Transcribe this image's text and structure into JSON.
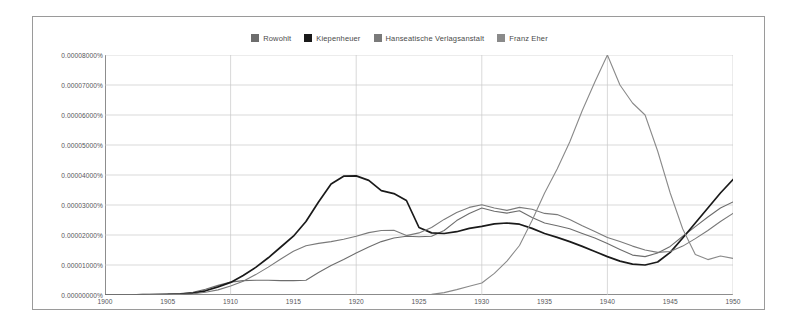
{
  "chart_data": {
    "type": "line",
    "title": "",
    "subtitle": "",
    "xlabel": "",
    "ylabel": "",
    "xlim": [
      1900,
      1950
    ],
    "ylim": [
      0,
      8e-05
    ],
    "grid": true,
    "legend_position": "top-center",
    "x_ticks": [
      "1900",
      "1905",
      "1910",
      "1915",
      "1920",
      "1925",
      "1930",
      "1935",
      "1940",
      "1945",
      "1950"
    ],
    "x_tick_values": [
      1900,
      1905,
      1910,
      1915,
      1920,
      1925,
      1930,
      1935,
      1940,
      1945,
      1950
    ],
    "y_ticks": [
      "0.00000000%",
      "0.00001000%",
      "0.00002000%",
      "0.00003000%",
      "0.00004000%",
      "0.00005000%",
      "0.00006000%",
      "0.00007000%",
      "0.00008000%"
    ],
    "y_tick_values": [
      0,
      1e-05,
      2e-05,
      3e-05,
      4e-05,
      5e-05,
      6e-05,
      7e-05,
      8e-05
    ],
    "x": [
      1900,
      1901,
      1902,
      1903,
      1904,
      1905,
      1906,
      1907,
      1908,
      1909,
      1910,
      1911,
      1912,
      1913,
      1914,
      1915,
      1916,
      1917,
      1918,
      1919,
      1920,
      1921,
      1922,
      1923,
      1924,
      1925,
      1926,
      1927,
      1928,
      1929,
      1930,
      1931,
      1932,
      1933,
      1934,
      1935,
      1936,
      1937,
      1938,
      1939,
      1940,
      1941,
      1942,
      1943,
      1944,
      1945,
      1946,
      1947,
      1948,
      1949,
      1950
    ],
    "series": [
      {
        "name": "Rowohlt",
        "color": "#6d6d6d",
        "width": 1.1,
        "values": [
          0.0,
          0.0,
          1e-07,
          1e-07,
          2e-07,
          3e-07,
          5e-07,
          9e-07,
          1.9e-06,
          3.2e-06,
          4.3e-06,
          4.8e-06,
          4.9e-06,
          4.9e-06,
          4.8e-06,
          4.8e-06,
          4.9e-06,
          7.5e-06,
          9.8e-06,
          1.18e-05,
          1.4e-05,
          1.6e-05,
          1.78e-05,
          1.9e-05,
          1.96e-05,
          1.94e-05,
          1.96e-05,
          2.15e-05,
          2.48e-05,
          2.72e-05,
          2.9e-05,
          2.79e-05,
          2.73e-05,
          2.81e-05,
          2.58e-05,
          2.4e-05,
          2.31e-05,
          2.21e-05,
          2.05e-05,
          1.9e-05,
          1.72e-05,
          1.52e-05,
          1.33e-05,
          1.28e-05,
          1.4e-05,
          1.62e-05,
          1.96e-05,
          2.28e-05,
          2.6e-05,
          2.9e-05,
          3.1e-05
        ]
      },
      {
        "name": "Kiepenheuer",
        "color": "#1a1a1a",
        "width": 1.7,
        "values": [
          0.0,
          0.0,
          0.0,
          1e-07,
          1e-07,
          2e-07,
          3e-07,
          6e-07,
          1.4e-06,
          2.7e-06,
          4.2e-06,
          6.5e-06,
          9.2e-06,
          1.24e-05,
          1.6e-05,
          1.96e-05,
          2.45e-05,
          3.1e-05,
          3.7e-05,
          3.96e-05,
          3.97e-05,
          3.82e-05,
          3.48e-05,
          3.38e-05,
          3.15e-05,
          2.25e-05,
          2.07e-05,
          2.05e-05,
          2.11e-05,
          2.22e-05,
          2.29e-05,
          2.37e-05,
          2.4e-05,
          2.36e-05,
          2.22e-05,
          2.05e-05,
          1.92e-05,
          1.78e-05,
          1.62e-05,
          1.45e-05,
          1.28e-05,
          1.13e-05,
          1.03e-05,
          1e-05,
          1.1e-05,
          1.42e-05,
          1.9e-05,
          2.4e-05,
          2.9e-05,
          3.4e-05,
          3.85e-05
        ]
      },
      {
        "name": "Hanseatische Verlagsanstalt",
        "color": "#7a7a7a",
        "width": 1.1,
        "values": [
          0.0,
          0.0,
          0.0,
          0.0,
          1e-07,
          1e-07,
          2e-07,
          4e-07,
          9e-07,
          1.7e-06,
          3e-06,
          4.6e-06,
          6.8e-06,
          9.3e-06,
          1.2e-05,
          1.46e-05,
          1.64e-05,
          1.72e-05,
          1.78e-05,
          1.86e-05,
          1.96e-05,
          2.08e-05,
          2.15e-05,
          2.16e-05,
          1.98e-05,
          2.07e-05,
          2.25e-05,
          2.52e-05,
          2.75e-05,
          2.92e-05,
          3.01e-05,
          2.9e-05,
          2.82e-05,
          2.92e-05,
          2.86e-05,
          2.72e-05,
          2.68e-05,
          2.52e-05,
          2.31e-05,
          2.12e-05,
          1.92e-05,
          1.78e-05,
          1.63e-05,
          1.5e-05,
          1.42e-05,
          1.45e-05,
          1.63e-05,
          1.88e-05,
          2.15e-05,
          2.45e-05,
          2.72e-05
        ]
      },
      {
        "name": "Franz Eher",
        "color": "#8a8a8a",
        "width": 1.1,
        "values": [
          0.0,
          0.0,
          0.0,
          0.0,
          0.0,
          0.0,
          0.0,
          0.0,
          0.0,
          0.0,
          0.0,
          0.0,
          0.0,
          0.0,
          0.0,
          0.0,
          0.0,
          0.0,
          0.0,
          0.0,
          0.0,
          0.0,
          0.0,
          0.0,
          0.0,
          0.0,
          2e-07,
          8e-07,
          1.8e-06,
          2.9e-06,
          4e-06,
          7.2e-06,
          1.13e-05,
          1.65e-05,
          2.48e-05,
          3.4e-05,
          4.2e-05,
          5.1e-05,
          6.15e-05,
          7.1e-05,
          8e-05,
          7e-05,
          6.4e-05,
          6e-05,
          4.8e-05,
          3.4e-05,
          2.2e-05,
          1.35e-05,
          1.18e-05,
          1.3e-05,
          1.22e-05
        ]
      }
    ]
  },
  "legend": {
    "items": [
      {
        "label": "Rowohlt"
      },
      {
        "label": "Kiepenheuer"
      },
      {
        "label": "Hanseatische Verlagsanstalt"
      },
      {
        "label": "Franz Eher"
      }
    ]
  }
}
